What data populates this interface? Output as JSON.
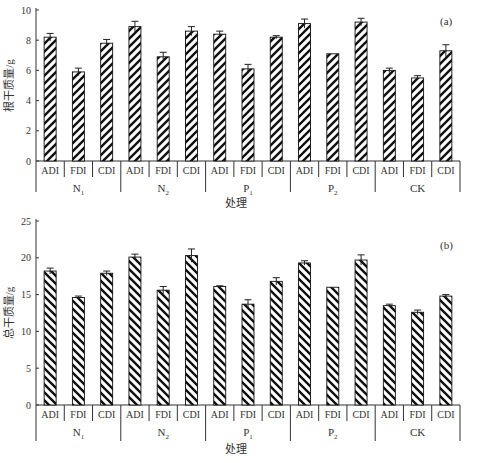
{
  "chart_data": [
    {
      "type": "bar",
      "panel_label": "(a)",
      "title": "",
      "xlabel": "处理",
      "ylabel": "根干质量/g",
      "ylim": [
        0,
        10
      ],
      "yticks": [
        0,
        2,
        4,
        6,
        8,
        10
      ],
      "grid": false,
      "pattern": "forward-hatch",
      "groups": [
        "N1",
        "N2",
        "P1",
        "P2",
        "CK"
      ],
      "categories": [
        "ADI",
        "FDI",
        "CDI"
      ],
      "series": [
        {
          "group": "N1",
          "values": [
            8.2,
            5.9,
            7.8
          ],
          "errors": [
            0.25,
            0.25,
            0.25
          ]
        },
        {
          "group": "N2",
          "values": [
            8.9,
            6.9,
            8.6
          ],
          "errors": [
            0.35,
            0.3,
            0.3
          ]
        },
        {
          "group": "P1",
          "values": [
            8.4,
            6.1,
            8.2
          ],
          "errors": [
            0.2,
            0.3,
            0.1
          ]
        },
        {
          "group": "P2",
          "values": [
            9.1,
            7.1,
            9.2
          ],
          "errors": [
            0.3,
            0.0,
            0.25
          ]
        },
        {
          "group": "CK",
          "values": [
            6.0,
            5.5,
            7.3
          ],
          "errors": [
            0.15,
            0.15,
            0.4
          ]
        }
      ]
    },
    {
      "type": "bar",
      "panel_label": "(b)",
      "title": "",
      "xlabel": "处理",
      "ylabel": "总干质量/g",
      "ylim": [
        0,
        25
      ],
      "yticks": [
        0,
        5,
        10,
        15,
        20,
        25
      ],
      "grid": false,
      "pattern": "backward-hatch",
      "groups": [
        "N1",
        "N2",
        "P1",
        "P2",
        "CK"
      ],
      "categories": [
        "ADI",
        "FDI",
        "CDI"
      ],
      "series": [
        {
          "group": "N1",
          "values": [
            18.2,
            14.6,
            17.9
          ],
          "errors": [
            0.4,
            0.2,
            0.3
          ]
        },
        {
          "group": "N2",
          "values": [
            20.1,
            15.6,
            20.3
          ],
          "errors": [
            0.4,
            0.5,
            0.9
          ]
        },
        {
          "group": "P1",
          "values": [
            16.1,
            13.7,
            16.8
          ],
          "errors": [
            0.1,
            0.6,
            0.5
          ]
        },
        {
          "group": "P2",
          "values": [
            19.3,
            16.0,
            19.7
          ],
          "errors": [
            0.3,
            0.0,
            0.7
          ]
        },
        {
          "group": "CK",
          "values": [
            13.5,
            12.6,
            14.8
          ],
          "errors": [
            0.2,
            0.3,
            0.2
          ]
        }
      ]
    }
  ],
  "group_labels": [
    {
      "main": "N",
      "sub": "1"
    },
    {
      "main": "N",
      "sub": "2"
    },
    {
      "main": "P",
      "sub": "1"
    },
    {
      "main": "P",
      "sub": "2"
    },
    {
      "main": "CK",
      "sub": ""
    }
  ],
  "colors": {
    "bar_fill": "#ffffff",
    "hatch": "#111111",
    "axis": "#333333"
  }
}
